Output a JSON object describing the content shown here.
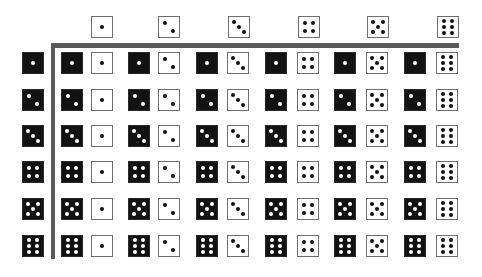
{
  "figure": {
    "colors": {
      "black_die": "#121212",
      "white_die": "#ffffff",
      "divider": "#5a5a5a",
      "white_pip": "#ffffff",
      "black_pip": "#111111"
    },
    "column_headers": [
      {
        "die": "white",
        "value": 1,
        "x": 91,
        "y": 16
      },
      {
        "die": "white",
        "value": 2,
        "x": 158,
        "y": 16
      },
      {
        "die": "white",
        "value": 3,
        "x": 228,
        "y": 16
      },
      {
        "die": "white",
        "value": 4,
        "x": 298,
        "y": 16
      },
      {
        "die": "white",
        "value": 5,
        "x": 367,
        "y": 16
      },
      {
        "die": "white",
        "value": 6,
        "x": 437,
        "y": 16
      }
    ],
    "row_headers": [
      {
        "die": "black",
        "value": 1,
        "x": 22,
        "y": 52
      },
      {
        "die": "black",
        "value": 2,
        "x": 22,
        "y": 89
      },
      {
        "die": "black",
        "value": 3,
        "x": 22,
        "y": 125
      },
      {
        "die": "black",
        "value": 4,
        "x": 22,
        "y": 161
      },
      {
        "die": "black",
        "value": 5,
        "x": 22,
        "y": 198
      },
      {
        "die": "black",
        "value": 6,
        "x": 22,
        "y": 235
      }
    ],
    "grid": {
      "row_y": [
        52,
        89,
        125,
        161,
        198,
        235
      ],
      "black_x": [
        61,
        128,
        196,
        265,
        334,
        404
      ],
      "white_x": [
        91,
        158,
        227,
        297,
        366,
        436
      ],
      "row_values": [
        1,
        2,
        3,
        4,
        5,
        6
      ],
      "col_values": [
        1,
        2,
        3,
        4,
        5,
        6
      ]
    }
  }
}
